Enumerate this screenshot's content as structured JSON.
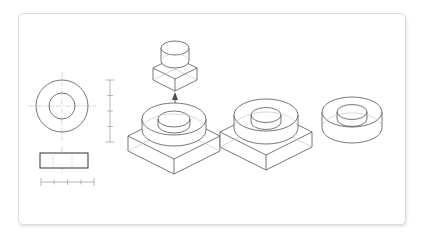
{
  "page": {
    "background_color": "#ffffff",
    "frame_border_color": "#dcdcdc",
    "line_color": "#4a4a52",
    "faint_line_color": "#b6b6be",
    "centerline_color": "#b0b0b8"
  },
  "drawing": {
    "type": "engineering-line-drawing",
    "views": [
      {
        "id": "orthographic-top-view",
        "label": "top view - concentric circles with centerlines",
        "kind": "2d-ortho",
        "center": {
          "x": 62,
          "y": 106
        },
        "outer_radius": 26,
        "inner_radius": 13,
        "centerline_overhang": 8
      },
      {
        "id": "orthographic-front-view",
        "label": "front view - rectangular section",
        "kind": "2d-ortho",
        "x": 40,
        "y": 153,
        "width": 48,
        "height": 15,
        "hidden_line_offsets": [
          13,
          22
        ]
      },
      {
        "id": "vertical-dimension-scale",
        "label": "vertical dimension scale",
        "kind": "dimension",
        "x": 110,
        "y_top": 80,
        "y_bottom": 142,
        "ticks": 4
      },
      {
        "id": "horizontal-dimension-scale",
        "label": "horizontal dimension scale",
        "kind": "dimension",
        "y": 182,
        "x_left": 41,
        "x_right": 94,
        "ticks": 4
      },
      {
        "id": "iso-boss-component",
        "label": "isometric square boss component (exploded above)",
        "kind": "isometric",
        "center": {
          "x": 175,
          "y": 68
        },
        "half_width": 22,
        "plate_thickness": 12,
        "cylinder_rx": 14,
        "cylinder_ry": 7,
        "cylinder_height": 13
      },
      {
        "id": "assembly-arrow",
        "label": "downward assembly direction arrow",
        "kind": "annotation",
        "x": 175,
        "y_top": 92,
        "y_bottom": 107,
        "direction": "down"
      },
      {
        "id": "iso-base-plate-1",
        "label": "isometric square base plate with bored cylindrical boss",
        "kind": "isometric",
        "center": {
          "x": 174,
          "y": 136
        },
        "half_width": 46,
        "plate_thickness": 15,
        "ring_outer_rx": 32,
        "ring_outer_ry": 16,
        "ring_inner_rx": 16,
        "ring_inner_ry": 8,
        "ring_height": 11
      },
      {
        "id": "iso-base-plate-2",
        "label": "isometric square base plate with thicker cylindrical boss",
        "kind": "isometric",
        "center": {
          "x": 266,
          "y": 132
        },
        "half_width": 46,
        "plate_thickness": 15,
        "ring_outer_rx": 32,
        "ring_outer_ry": 16,
        "ring_inner_rx": 15,
        "ring_inner_ry": 7.5,
        "ring_height": 13
      },
      {
        "id": "iso-washer",
        "label": "isometric plain cylindrical washer / ring",
        "kind": "isometric",
        "center": {
          "x": 352,
          "y": 128
        },
        "outer_rx": 30,
        "outer_ry": 15,
        "inner_rx": 15,
        "inner_ry": 7.5,
        "height": 16
      }
    ]
  }
}
